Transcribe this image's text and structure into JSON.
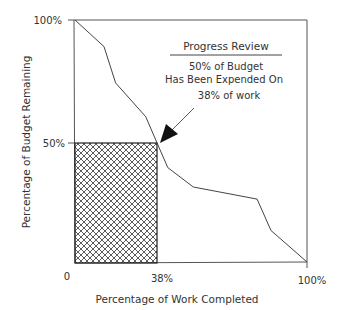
{
  "chart_data": {
    "type": "line",
    "title": "",
    "xlabel": "Percentage of Work Completed",
    "ylabel": "Percentage of Budget Remaining",
    "xlim": [
      0,
      100
    ],
    "ylim": [
      0,
      100
    ],
    "x_ticks": [
      "0",
      "38%",
      "100%"
    ],
    "y_ticks": [
      "100%",
      "50%"
    ],
    "grid": false,
    "series": [
      {
        "name": "Budget Remaining",
        "x": [
          0,
          12.5,
          17.5,
          30.5,
          35,
          40,
          51,
          78.5,
          84.5,
          100
        ],
        "y": [
          100,
          89,
          74,
          60,
          50,
          39,
          31,
          26,
          13,
          0
        ]
      }
    ],
    "highlight_region": {
      "x": [
        0,
        38
      ],
      "y": [
        0,
        50
      ],
      "pattern": "crosshatch"
    },
    "annotation": {
      "heading": "Progress Review",
      "lines": [
        "50% of Budget",
        "Has Been Expended On",
        "38% of work"
      ],
      "arrow_to": {
        "x": 36,
        "y": 50
      }
    }
  },
  "axes": {
    "x_label": "Percentage of Work Completed",
    "y_label": "Percentage of Budget Remaining",
    "x_tick_0": "0",
    "x_tick_38": "38%",
    "x_tick_100": "100%",
    "y_tick_100": "100%",
    "y_tick_50": "50%"
  },
  "annotation": {
    "heading": "Progress Review",
    "line1": "50% of Budget",
    "line2": "Has Been Expended On",
    "line3": "38% of work"
  }
}
